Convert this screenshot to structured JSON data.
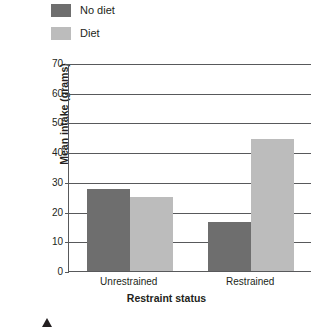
{
  "legend": {
    "position": "top-left",
    "items": [
      {
        "label": "No diet",
        "color": "#6e6e6e"
      },
      {
        "label": "Diet",
        "color": "#bcbcbc"
      }
    ]
  },
  "axes": {
    "x_title": "Restraint status",
    "y_title": "Mean intake (grams)",
    "y_ticks": [
      "0",
      "10",
      "20",
      "30",
      "40",
      "50",
      "60",
      "70"
    ],
    "x_ticks": [
      "Unrestrained",
      "Restrained"
    ]
  },
  "colors": {
    "no_diet": "#6e6e6e",
    "diet": "#bcbcbc",
    "axis": "#58595b",
    "text": "#231f20",
    "background": "#ffffff"
  },
  "chart_data": {
    "type": "bar",
    "title": "",
    "xlabel": "Restraint status",
    "ylabel": "Mean intake (grams)",
    "categories": [
      "Unrestrained",
      "Restrained"
    ],
    "series": [
      {
        "name": "No diet",
        "color": "#6e6e6e",
        "values": [
          27.5,
          16.5
        ]
      },
      {
        "name": "Diet",
        "color": "#bcbcbc",
        "values": [
          25.0,
          44.5
        ]
      }
    ],
    "ylim": [
      0,
      70
    ],
    "ytick_step": 10,
    "grid": true,
    "grid_axis": "y",
    "legend_position": "top-left"
  },
  "page_marker": {
    "glyph": "triangle-up"
  }
}
